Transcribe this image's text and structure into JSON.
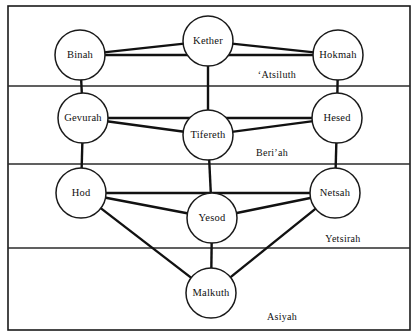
{
  "diagram": {
    "type": "node-link-diagram",
    "frame": {
      "x": 8,
      "y": 6,
      "width": 402,
      "height": 324,
      "stroke": "#1a1a1a"
    },
    "background": "#ffffff",
    "line_color": "#111111",
    "node_fill": "#ffffff",
    "node_stroke": "#1a1a1a",
    "nodes": [
      {
        "id": "kether",
        "label": "Kether",
        "cx": 208,
        "cy": 41,
        "r": 25
      },
      {
        "id": "binah",
        "label": "Binah",
        "cx": 80,
        "cy": 55,
        "r": 25
      },
      {
        "id": "hokmah",
        "label": "Hokmah",
        "cx": 338,
        "cy": 55,
        "r": 25
      },
      {
        "id": "gevurah",
        "label": "Gevurah",
        "cx": 83,
        "cy": 118,
        "r": 25
      },
      {
        "id": "tifereth",
        "label": "Tifereth",
        "cx": 208,
        "cy": 135,
        "r": 25
      },
      {
        "id": "hesed",
        "label": "Hesed",
        "cx": 337,
        "cy": 118,
        "r": 25
      },
      {
        "id": "hod",
        "label": "Hod",
        "cx": 81,
        "cy": 193,
        "r": 25
      },
      {
        "id": "yesod",
        "label": "Yesod",
        "cx": 212,
        "cy": 218,
        "r": 25
      },
      {
        "id": "netsah",
        "label": "Netsah",
        "cx": 335,
        "cy": 193,
        "r": 25
      },
      {
        "id": "malkuth",
        "label": "Malkuth",
        "cx": 211,
        "cy": 293,
        "r": 25
      }
    ],
    "edges": [
      {
        "from": "binah",
        "to": "kether"
      },
      {
        "from": "kether",
        "to": "hokmah"
      },
      {
        "from": "binah",
        "to": "hokmah"
      },
      {
        "from": "binah",
        "to": "gevurah"
      },
      {
        "from": "hokmah",
        "to": "hesed"
      },
      {
        "from": "kether",
        "to": "tifereth"
      },
      {
        "from": "gevurah",
        "to": "hesed"
      },
      {
        "from": "gevurah",
        "to": "tifereth"
      },
      {
        "from": "tifereth",
        "to": "hesed"
      },
      {
        "from": "gevurah",
        "to": "hod"
      },
      {
        "from": "hesed",
        "to": "netsah"
      },
      {
        "from": "tifereth",
        "to": "yesod"
      },
      {
        "from": "hod",
        "to": "netsah"
      },
      {
        "from": "hod",
        "to": "yesod"
      },
      {
        "from": "yesod",
        "to": "netsah"
      },
      {
        "from": "hod",
        "to": "malkuth"
      },
      {
        "from": "netsah",
        "to": "malkuth"
      },
      {
        "from": "yesod",
        "to": "malkuth"
      }
    ],
    "band_dividers": [
      {
        "id": "divider-atsiluth-beriah",
        "y": 86
      },
      {
        "id": "divider-beriah-yetsirah",
        "y": 164
      },
      {
        "id": "divider-yetsirah-asiyah",
        "y": 248
      }
    ],
    "world_labels": [
      {
        "id": "atsiluth",
        "label": "ʻAtsiluth",
        "x": 277,
        "y": 76
      },
      {
        "id": "beriah",
        "label": "Beriʼah",
        "x": 272,
        "y": 154
      },
      {
        "id": "yetsirah",
        "label": "Yetsirah",
        "x": 343,
        "y": 240
      },
      {
        "id": "asiyah",
        "label": "Asiyah",
        "x": 282,
        "y": 318
      }
    ]
  }
}
